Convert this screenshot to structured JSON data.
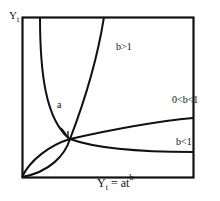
{
  "diagram": {
    "y_axis_label": "Y",
    "y_axis_label_sub": "t",
    "x_caption_lhs": "Y",
    "x_caption_lhs_sub": "t",
    "x_caption_eq": " = at",
    "x_caption_sup": "b",
    "point_label": "a",
    "curves": [
      {
        "name": "b-greater-than-1",
        "label": "b>1"
      },
      {
        "name": "b-between-0-and-1",
        "label": "0<b<1"
      },
      {
        "name": "b-less-than-1",
        "label": "b<1"
      }
    ],
    "stroke_color": "#111111",
    "background_color": "#ffffff"
  }
}
